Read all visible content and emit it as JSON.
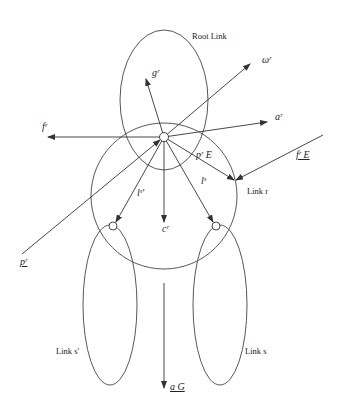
{
  "diagram": {
    "type": "link-dynamics-schematic",
    "stroke_color": "#333333",
    "background": "#ffffff",
    "labels": {
      "root_link": "Root Link",
      "link_r": "Link r",
      "link_s_prime": "Link s′",
      "link_s": "Link s",
      "omega_r": "ωʳ",
      "g_r": "gʳ",
      "a_r": "aʳ",
      "f_r": "fʳ",
      "p_r_E": "pʳ E",
      "f_r_E": "fʳ E",
      "l_s_prime": "lˢ′",
      "l_s": "lˢ",
      "c_r": "cʳ",
      "p_r": "pʳ",
      "a_G": "a G"
    },
    "nodes": [
      {
        "id": "root-joint",
        "x": 164,
        "y": 137
      },
      {
        "id": "joint-s-prime",
        "x": 113,
        "y": 226
      },
      {
        "id": "joint-s",
        "x": 216,
        "y": 226
      }
    ],
    "links": [
      {
        "id": "root-link",
        "shape": "ellipse",
        "label_key": "root_link"
      },
      {
        "id": "link-r",
        "shape": "circle",
        "label_key": "link_r"
      },
      {
        "id": "link-s-prime",
        "shape": "ellipse",
        "label_key": "link_s_prime"
      },
      {
        "id": "link-s",
        "shape": "ellipse",
        "label_key": "link_s"
      }
    ],
    "vectors": [
      {
        "id": "omega-r",
        "from": "root-joint",
        "direction": "up-right"
      },
      {
        "id": "g-r",
        "from": "root-joint",
        "direction": "up-left"
      },
      {
        "id": "a-r",
        "from": "root-joint",
        "direction": "right"
      },
      {
        "id": "f-r",
        "from": "root-joint",
        "direction": "left"
      },
      {
        "id": "p-r-E",
        "from": "root-joint",
        "to": "end-effector"
      },
      {
        "id": "f-r-E",
        "from": "external",
        "to": "end-effector"
      },
      {
        "id": "l-s-prime",
        "from": "root-joint",
        "to": "joint-s-prime"
      },
      {
        "id": "l-s",
        "from": "root-joint",
        "to": "joint-s"
      },
      {
        "id": "c-r",
        "from": "root-joint",
        "direction": "down"
      },
      {
        "id": "p-r",
        "from": "external",
        "to": "root-joint"
      },
      {
        "id": "a-G",
        "direction": "down"
      }
    ]
  }
}
